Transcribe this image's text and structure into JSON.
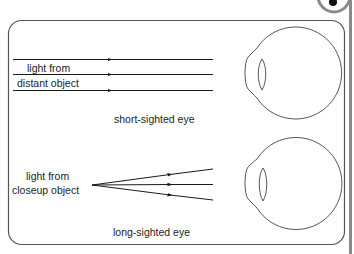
{
  "diagram": {
    "panels": [
      {
        "id": "short-sighted",
        "label_line1": "light from",
        "label_line2": "distant object",
        "caption": "short-sighted eye",
        "ray_type": "parallel"
      },
      {
        "id": "long-sighted",
        "label_line1": "light from",
        "label_line2": "closeup object",
        "caption": "long-sighted eye",
        "ray_type": "diverging"
      }
    ],
    "colors": {
      "line": "#1a1a1a",
      "frame": "#555555",
      "eye_outline": "#444444",
      "side_bar": "#8a8a8a",
      "badge_ring": "#8a8a8a",
      "badge_dot": "#111111"
    }
  }
}
